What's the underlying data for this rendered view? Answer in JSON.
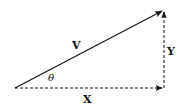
{
  "diagram": {
    "type": "vector-decomposition",
    "colors": {
      "stroke": "#111111",
      "background": "#ffffff"
    },
    "labels": {
      "vector": "V",
      "x_component": "X",
      "y_component": "Y",
      "angle": "θ"
    },
    "points": {
      "origin": [
        15,
        88
      ],
      "tip": [
        164,
        10
      ],
      "corner": [
        164,
        88
      ]
    }
  }
}
